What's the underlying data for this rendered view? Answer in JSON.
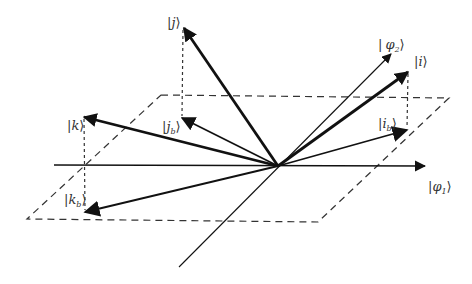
{
  "colors": {
    "stroke": "#111111",
    "dash": "#333333",
    "label": "#333333",
    "background": "#ffffff"
  },
  "labels": {
    "j": "j",
    "j_b_main": "j",
    "j_b_sub": "b",
    "k": "k",
    "k_b_main": "k",
    "k_b_sub": "b",
    "i": "i",
    "i_b_main": "i",
    "i_b_sub": "b",
    "phi1_main": "φ",
    "phi1_sub": "1",
    "phi2_main": "φ",
    "phi2_sub": "2",
    "ket_open": "|",
    "ket_close": "⟩"
  },
  "geometry": {
    "origin": [
      278,
      166
    ],
    "plane": [
      [
        161,
        95
      ],
      [
        449,
        98
      ],
      [
        318,
        222
      ],
      [
        27,
        219
      ]
    ],
    "axis_phi1": {
      "from": [
        54,
        165
      ],
      "to": [
        425,
        166
      ]
    },
    "axis_phi2": {
      "from": [
        179,
        267
      ],
      "to": [
        391,
        54
      ]
    },
    "vectors": {
      "j": [
        184,
        28
      ],
      "j_b": [
        182,
        118
      ],
      "k": [
        84,
        117
      ],
      "k_b": [
        85,
        212
      ],
      "i": [
        408,
        72
      ],
      "i_b": [
        407,
        130
      ]
    }
  }
}
